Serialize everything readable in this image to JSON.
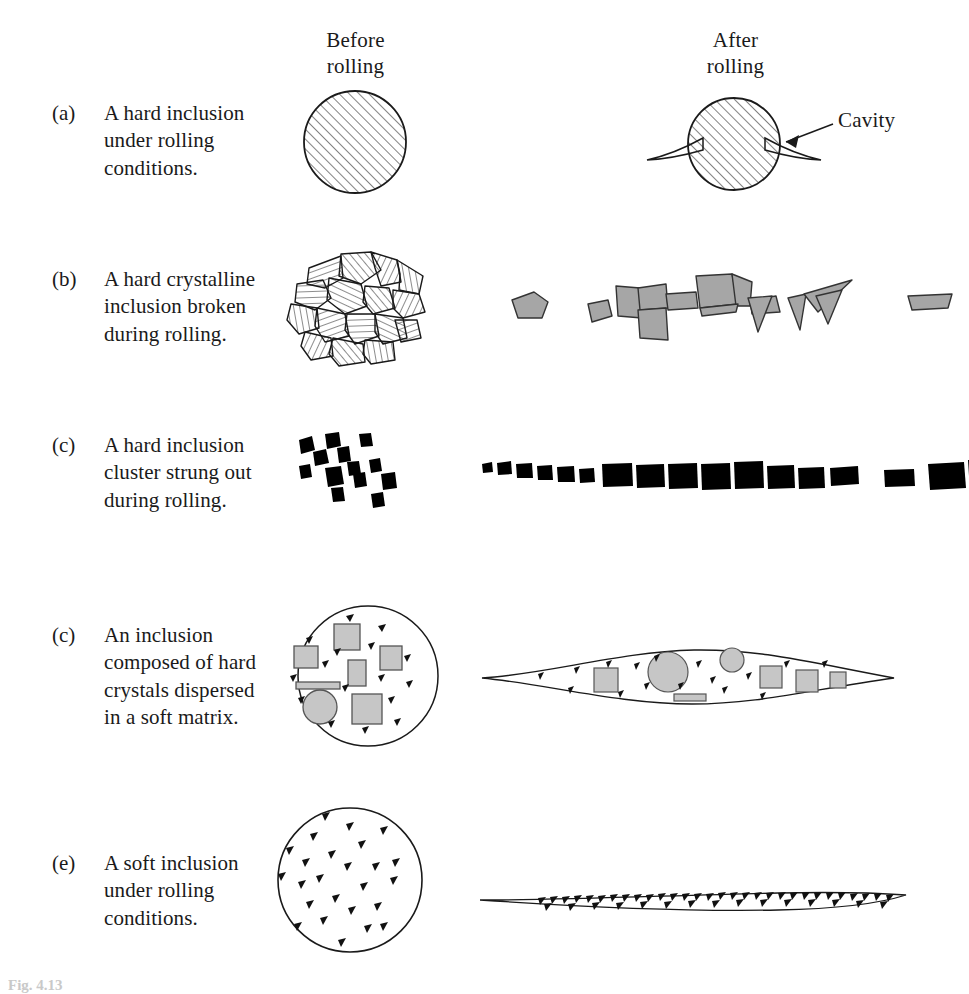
{
  "figure": {
    "columns": {
      "before": "Before\nrolling",
      "after": "After\nrolling"
    },
    "annotations": {
      "cavity": "Cavity"
    },
    "caption": "Fig. 4.13",
    "rows": [
      {
        "tag": "(a)",
        "text": "A hard inclusion\nunder rolling\nconditions.",
        "before_shape": "hatched-circle",
        "after_shape": "hatched-circle-with-cavities"
      },
      {
        "tag": "(b)",
        "text": "A hard crystalline\ninclusion broken\nduring rolling.",
        "before_shape": "hatched-polygon-cluster",
        "after_shape": "gray-polygon-string"
      },
      {
        "tag": "(c)",
        "text": "A hard inclusion\ncluster strung out\nduring rolling.",
        "before_shape": "scattered-black-particles",
        "after_shape": "strung-black-particles"
      },
      {
        "tag": "(c)",
        "text": "An inclusion\ncomposed of hard\ncrystals dispersed\nin a soft matrix.",
        "before_shape": "circle-with-gray-crystals",
        "after_shape": "lens-with-gray-crystals"
      },
      {
        "tag": "(e)",
        "text": "A soft inclusion\nunder rolling\nconditions.",
        "before_shape": "circle-with-flecks",
        "after_shape": "flattened-fleck-band"
      }
    ]
  },
  "colors": {
    "ink": "#1a1a1a",
    "gray_fill": "#a6a6a6",
    "black_fill": "#000000",
    "background": "#ffffff"
  }
}
